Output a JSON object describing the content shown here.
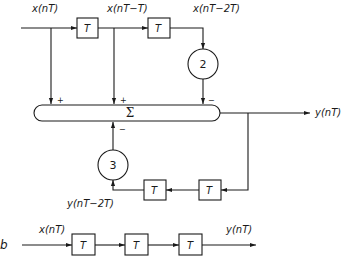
{
  "diagram_a": {
    "signals": {
      "x_n": "x(nT)",
      "x_n1": "x(nT−T)",
      "x_n2": "x(nT−2T)",
      "y_n": "y(nT)",
      "y_n2": "y(nT−2T)"
    },
    "delay_label": "T",
    "multipliers": {
      "feedforward": "2",
      "feedback": "3"
    },
    "summer": {
      "symbol": "Σ",
      "input_signs": [
        "+",
        "+",
        "−",
        "−"
      ]
    }
  },
  "diagram_b": {
    "part_label": "b",
    "input": "x(nT)",
    "output": "y(nT)",
    "delay_label": "T",
    "delay_count": 3
  },
  "colors": {
    "ink": "#1a1a1a",
    "background": "#ffffff"
  }
}
